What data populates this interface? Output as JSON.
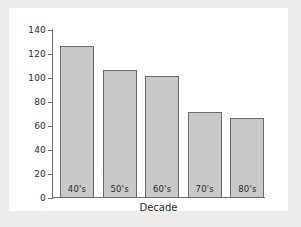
{
  "chart_data": {
    "type": "bar",
    "title": "",
    "subtitle": "",
    "xlabel": "Decade",
    "ylabel": "",
    "categories": [
      "40's",
      "50's",
      "60's",
      "70's",
      "80's"
    ],
    "values": [
      127,
      107,
      102,
      72,
      67
    ],
    "series": [
      {
        "name": "Count",
        "values": [
          127,
          107,
          102,
          72,
          67
        ]
      }
    ],
    "ylim": [
      0,
      140
    ],
    "yticks": [
      0,
      20,
      40,
      60,
      80,
      100,
      120,
      140
    ],
    "ytick_labels": [
      "0",
      "20",
      "40",
      "60",
      "80",
      "100",
      "120",
      "140"
    ],
    "grid": false,
    "legend": false,
    "legend_position": "none",
    "bar_labels_inside": true,
    "colors": {
      "bar_fill": "#c9c9c9",
      "bar_edge": "#6a6a6a",
      "axis": "#6f6f6f",
      "text": "#2b2b2b",
      "plot_background": "#ffffff",
      "figure_background": "#edecea"
    }
  }
}
